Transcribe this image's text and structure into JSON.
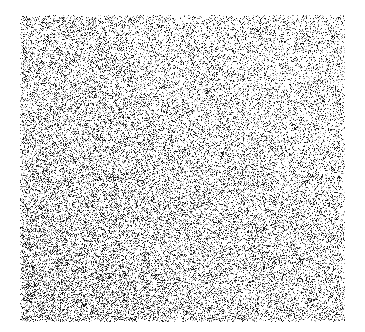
{
  "image": {
    "kind": "noise-field",
    "description": "Rectangular salt-and-pepper random noise texture on a white page",
    "canvas_width": 365,
    "canvas_height": 332,
    "background_color": "#ffffff"
  },
  "noise_field": {
    "name": "salt-and-pepper-noise-rectangle",
    "left": 20,
    "top": 15,
    "right": 345,
    "bottom": 322,
    "width": 325,
    "height": 307,
    "grain_size_px": 1,
    "seed": 20240517,
    "base_density": 0.3,
    "density_min": 0.235,
    "density_max": 0.375,
    "gradient": {
      "direction": "upper-right-lighter-to-lower-left-darker",
      "x_weight": -0.055,
      "y_weight": 0.055
    },
    "edge_softness_px": 2,
    "dark_color": "#1a1a1a",
    "mid_color": "#808080",
    "light_color": "#c8c8c8",
    "paper_color": "#ffffff",
    "tone_mix": {
      "dark": 0.42,
      "mid": 0.34,
      "light": 0.24
    }
  }
}
